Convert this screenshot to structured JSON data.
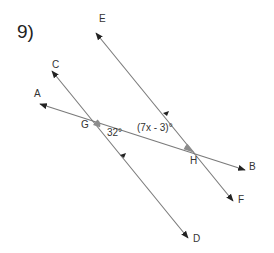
{
  "problem": {
    "number": "9)"
  },
  "points": {
    "A": "A",
    "B": "B",
    "C": "C",
    "D": "D",
    "E": "E",
    "F": "F",
    "G": "G",
    "H": "H"
  },
  "angles": {
    "at_G": "32°",
    "at_H": "(7x - 3)°"
  },
  "lines": [
    {
      "name": "AB",
      "from": "A",
      "to": "B",
      "type": "transversal"
    },
    {
      "name": "CD",
      "from": "C",
      "to": "D",
      "type": "parallel"
    },
    {
      "name": "EF",
      "from": "E",
      "to": "F",
      "type": "parallel"
    }
  ],
  "colors": {
    "line": "#7a7a7a",
    "arrow": "#222222",
    "angle_fill": "#8c8c8c",
    "text": "#333333"
  }
}
